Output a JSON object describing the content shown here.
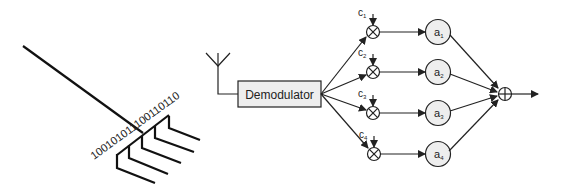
{
  "bitstream": {
    "text": "100101011100110110"
  },
  "antenna": {
    "icon": "antenna-icon"
  },
  "demodulator": {
    "label": "Demodulator"
  },
  "branches": [
    {
      "coef": "c",
      "coef_sub": "1",
      "tap": "a",
      "tap_sub": "1"
    },
    {
      "coef": "c",
      "coef_sub": "2",
      "tap": "a",
      "tap_sub": "2"
    },
    {
      "coef": "c",
      "coef_sub": "3",
      "tap": "a",
      "tap_sub": "3"
    },
    {
      "coef": "c",
      "coef_sub": "4",
      "tap": "a",
      "tap_sub": "4"
    }
  ],
  "colors": {
    "stroke": "#222222",
    "node_fill": "#eeeeee",
    "box_fill": "#eeeeee"
  }
}
